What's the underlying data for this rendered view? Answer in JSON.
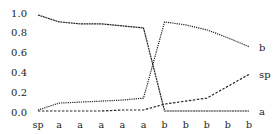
{
  "chart_data": {
    "type": "line",
    "title": "",
    "xlabel": "",
    "ylabel": "",
    "categories": [
      "sp",
      "a",
      "a",
      "a",
      "a",
      "a",
      "b",
      "b",
      "b",
      "b",
      "b"
    ],
    "yticks": [
      "0.0",
      "0.2",
      "0.4",
      "0.6",
      "0.8",
      "1.0"
    ],
    "ylim": [
      0,
      1.0
    ],
    "grid": false,
    "legend": "inline labels at line ends",
    "series": [
      {
        "name": "a",
        "label": "a",
        "style": "solid",
        "values": [
          0.98,
          0.91,
          0.89,
          0.89,
          0.87,
          0.85,
          0.01,
          0.01,
          0.01,
          0.01,
          0.01
        ]
      },
      {
        "name": "b",
        "label": "b",
        "style": "dotted",
        "values": [
          0.02,
          0.09,
          0.1,
          0.11,
          0.12,
          0.14,
          0.91,
          0.88,
          0.83,
          0.75,
          0.66
        ]
      },
      {
        "name": "sp",
        "label": "sp",
        "style": "dashed",
        "values": [
          0.01,
          0.01,
          0.01,
          0.01,
          0.02,
          0.02,
          0.08,
          0.11,
          0.14,
          0.26,
          0.38
        ]
      }
    ]
  }
}
